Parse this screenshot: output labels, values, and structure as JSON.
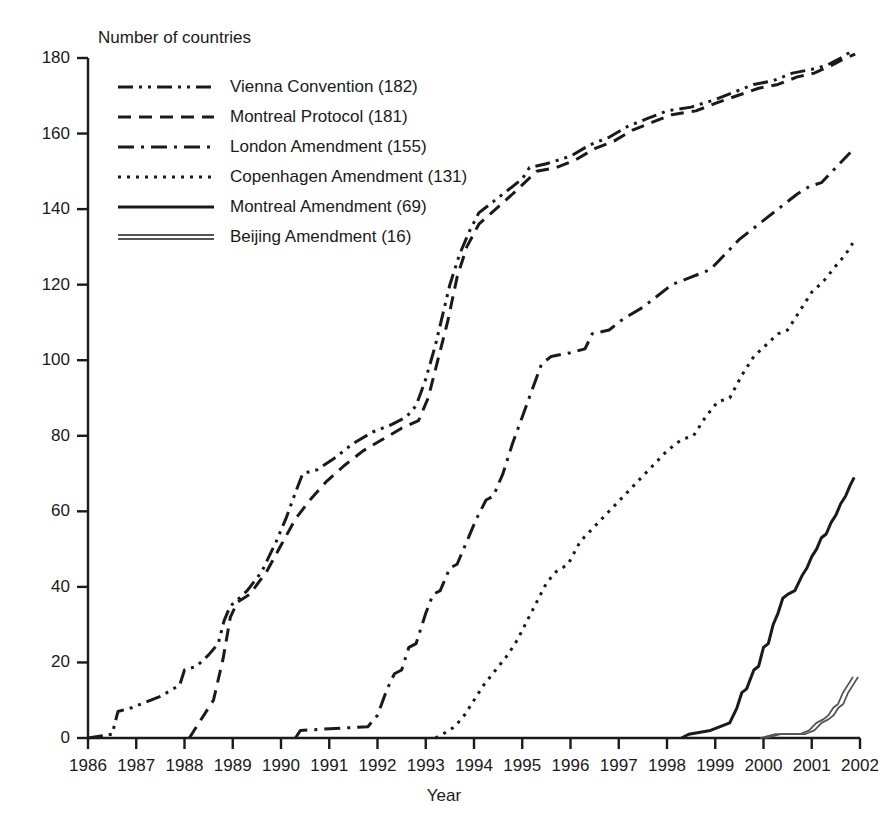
{
  "chart_data": {
    "type": "line",
    "title": "",
    "ylabel": "Number of countries",
    "xlabel": "Year",
    "xlim": [
      1986,
      2002
    ],
    "ylim": [
      0,
      180
    ],
    "xticks": [
      "1986",
      "1987",
      "1988",
      "1989",
      "1990",
      "1991",
      "1992",
      "1993",
      "1994",
      "1995",
      "1996",
      "1997",
      "1998",
      "1999",
      "2000",
      "2001",
      "2002"
    ],
    "yticks": [
      "0",
      "20",
      "40",
      "60",
      "80",
      "100",
      "120",
      "140",
      "160",
      "180"
    ],
    "grid": false,
    "legend_position": "upper-left",
    "series": [
      {
        "name": "Vienna Convention (182)",
        "label": "Vienna Convention",
        "final_value": 182,
        "style": "dash-dot-dot",
        "color": "#1a1a1a",
        "points": [
          [
            1986.0,
            0
          ],
          [
            1986.5,
            1
          ],
          [
            1986.62,
            7
          ],
          [
            1986.9,
            8
          ],
          [
            1987.5,
            11
          ],
          [
            1987.9,
            14
          ],
          [
            1988.0,
            18
          ],
          [
            1988.25,
            19
          ],
          [
            1988.5,
            22
          ],
          [
            1988.7,
            25
          ],
          [
            1988.82,
            31
          ],
          [
            1988.95,
            35
          ],
          [
            1989.05,
            36
          ],
          [
            1989.3,
            39
          ],
          [
            1989.6,
            44
          ],
          [
            1989.9,
            52
          ],
          [
            1990.1,
            58
          ],
          [
            1990.3,
            65
          ],
          [
            1990.45,
            70
          ],
          [
            1990.75,
            71
          ],
          [
            1991.1,
            74
          ],
          [
            1991.5,
            78
          ],
          [
            1991.9,
            81
          ],
          [
            1992.3,
            83
          ],
          [
            1992.6,
            85
          ],
          [
            1992.8,
            88
          ],
          [
            1993.0,
            95
          ],
          [
            1993.2,
            104
          ],
          [
            1993.35,
            112
          ],
          [
            1993.5,
            120
          ],
          [
            1993.7,
            128
          ],
          [
            1993.9,
            134
          ],
          [
            1994.1,
            139
          ],
          [
            1994.4,
            142
          ],
          [
            1994.7,
            145
          ],
          [
            1995.0,
            148
          ],
          [
            1995.15,
            151
          ],
          [
            1995.5,
            152
          ],
          [
            1996.0,
            154
          ],
          [
            1996.4,
            157
          ],
          [
            1996.8,
            159
          ],
          [
            1997.2,
            162
          ],
          [
            1997.6,
            164
          ],
          [
            1998.0,
            166
          ],
          [
            1998.5,
            167
          ],
          [
            1999.0,
            169
          ],
          [
            1999.4,
            171
          ],
          [
            1999.8,
            173
          ],
          [
            2000.2,
            174
          ],
          [
            2000.6,
            176
          ],
          [
            2001.0,
            177
          ],
          [
            2001.3,
            178
          ],
          [
            2001.6,
            180
          ],
          [
            2001.85,
            182
          ]
        ]
      },
      {
        "name": "Montreal Protocol (181)",
        "label": "Montreal Protocol",
        "final_value": 181,
        "style": "dashed",
        "color": "#1a1a1a",
        "points": [
          [
            1988.1,
            0
          ],
          [
            1988.3,
            4
          ],
          [
            1988.6,
            10
          ],
          [
            1988.8,
            21
          ],
          [
            1988.95,
            32
          ],
          [
            1989.1,
            36
          ],
          [
            1989.35,
            38
          ],
          [
            1989.7,
            44
          ],
          [
            1990.0,
            51
          ],
          [
            1990.3,
            58
          ],
          [
            1990.6,
            63
          ],
          [
            1990.95,
            68
          ],
          [
            1991.3,
            72
          ],
          [
            1991.7,
            76
          ],
          [
            1992.1,
            79
          ],
          [
            1992.5,
            82
          ],
          [
            1992.85,
            84
          ],
          [
            1993.05,
            90
          ],
          [
            1993.25,
            100
          ],
          [
            1993.45,
            110
          ],
          [
            1993.65,
            122
          ],
          [
            1993.85,
            130
          ],
          [
            1994.1,
            136
          ],
          [
            1994.45,
            140
          ],
          [
            1994.8,
            144
          ],
          [
            1995.05,
            147
          ],
          [
            1995.3,
            150
          ],
          [
            1995.7,
            151
          ],
          [
            1996.1,
            153
          ],
          [
            1996.5,
            156
          ],
          [
            1996.9,
            158
          ],
          [
            1997.3,
            161
          ],
          [
            1997.7,
            163
          ],
          [
            1998.1,
            165
          ],
          [
            1998.6,
            166
          ],
          [
            1999.0,
            168
          ],
          [
            1999.45,
            170
          ],
          [
            1999.9,
            172
          ],
          [
            2000.3,
            173
          ],
          [
            2000.7,
            175
          ],
          [
            2001.05,
            176
          ],
          [
            2001.4,
            178
          ],
          [
            2001.7,
            180
          ],
          [
            2001.9,
            181
          ]
        ]
      },
      {
        "name": "London Amendment (155)",
        "label": "London Amendment",
        "final_value": 155,
        "style": "dash-dot",
        "color": "#1a1a1a",
        "points": [
          [
            1990.3,
            0
          ],
          [
            1990.4,
            2
          ],
          [
            1991.8,
            3
          ],
          [
            1992.0,
            6
          ],
          [
            1992.2,
            13
          ],
          [
            1992.35,
            17
          ],
          [
            1992.5,
            18
          ],
          [
            1992.65,
            24
          ],
          [
            1992.8,
            25
          ],
          [
            1993.0,
            33
          ],
          [
            1993.15,
            38
          ],
          [
            1993.3,
            39
          ],
          [
            1993.5,
            45
          ],
          [
            1993.65,
            46
          ],
          [
            1993.85,
            52
          ],
          [
            1994.05,
            58
          ],
          [
            1994.25,
            63
          ],
          [
            1994.4,
            64
          ],
          [
            1994.6,
            70
          ],
          [
            1994.8,
            78
          ],
          [
            1995.0,
            85
          ],
          [
            1995.2,
            92
          ],
          [
            1995.4,
            99
          ],
          [
            1995.6,
            101
          ],
          [
            1996.0,
            102
          ],
          [
            1996.3,
            103
          ],
          [
            1996.45,
            107
          ],
          [
            1996.8,
            108
          ],
          [
            1997.1,
            111
          ],
          [
            1997.5,
            114
          ],
          [
            1997.8,
            117
          ],
          [
            1998.1,
            120
          ],
          [
            1998.5,
            122
          ],
          [
            1998.9,
            124
          ],
          [
            1999.2,
            128
          ],
          [
            1999.5,
            132
          ],
          [
            1999.8,
            135
          ],
          [
            2000.1,
            138
          ],
          [
            2000.4,
            141
          ],
          [
            2000.7,
            144
          ],
          [
            2000.95,
            146
          ],
          [
            2001.2,
            147
          ],
          [
            2001.5,
            151
          ],
          [
            2001.8,
            155
          ]
        ]
      },
      {
        "name": "Copenhagen Amendment (131)",
        "label": "Copenhagen Amendment",
        "final_value": 131,
        "style": "dotted",
        "color": "#1a1a1a",
        "points": [
          [
            1993.2,
            0
          ],
          [
            1993.35,
            1
          ],
          [
            1993.6,
            3
          ],
          [
            1993.8,
            6
          ],
          [
            1994.0,
            10
          ],
          [
            1994.2,
            14
          ],
          [
            1994.45,
            18
          ],
          [
            1994.7,
            22
          ],
          [
            1994.9,
            26
          ],
          [
            1995.1,
            31
          ],
          [
            1995.3,
            36
          ],
          [
            1995.5,
            41
          ],
          [
            1995.7,
            44
          ],
          [
            1995.95,
            46
          ],
          [
            1996.2,
            52
          ],
          [
            1996.5,
            56
          ],
          [
            1996.8,
            60
          ],
          [
            1997.1,
            64
          ],
          [
            1997.4,
            68
          ],
          [
            1997.7,
            72
          ],
          [
            1998.0,
            76
          ],
          [
            1998.3,
            79
          ],
          [
            1998.55,
            80
          ],
          [
            1998.8,
            85
          ],
          [
            1999.05,
            89
          ],
          [
            1999.3,
            90
          ],
          [
            1999.55,
            96
          ],
          [
            1999.8,
            101
          ],
          [
            2000.05,
            104
          ],
          [
            2000.3,
            107
          ],
          [
            2000.5,
            108
          ],
          [
            2000.75,
            113
          ],
          [
            2001.0,
            118
          ],
          [
            2001.25,
            121
          ],
          [
            2001.5,
            125
          ],
          [
            2001.7,
            128
          ],
          [
            2001.85,
            131
          ]
        ]
      },
      {
        "name": "Montreal Amendment (69)",
        "label": "Montreal Amendment",
        "final_value": 69,
        "style": "solid",
        "color": "#1a1a1a",
        "points": [
          [
            1998.3,
            0
          ],
          [
            1998.45,
            1
          ],
          [
            1998.9,
            2
          ],
          [
            1999.1,
            3
          ],
          [
            1999.3,
            4
          ],
          [
            1999.45,
            8
          ],
          [
            1999.55,
            12
          ],
          [
            1999.65,
            13
          ],
          [
            1999.8,
            18
          ],
          [
            1999.9,
            19
          ],
          [
            2000.0,
            24
          ],
          [
            2000.1,
            25
          ],
          [
            2000.2,
            30
          ],
          [
            2000.3,
            33
          ],
          [
            2000.4,
            37
          ],
          [
            2000.5,
            38
          ],
          [
            2000.65,
            39
          ],
          [
            2000.8,
            43
          ],
          [
            2000.9,
            45
          ],
          [
            2001.0,
            48
          ],
          [
            2001.1,
            50
          ],
          [
            2001.2,
            53
          ],
          [
            2001.3,
            54
          ],
          [
            2001.4,
            57
          ],
          [
            2001.5,
            59
          ],
          [
            2001.6,
            62
          ],
          [
            2001.7,
            64
          ],
          [
            2001.8,
            67
          ],
          [
            2001.88,
            69
          ]
        ]
      },
      {
        "name": "Beijing Amendment (16)",
        "label": "Beijing Amendment",
        "final_value": 16,
        "style": "double",
        "color": "#555555",
        "points": [
          [
            2000.0,
            0
          ],
          [
            2000.3,
            1
          ],
          [
            2000.8,
            1
          ],
          [
            2001.0,
            2
          ],
          [
            2001.15,
            4
          ],
          [
            2001.3,
            5
          ],
          [
            2001.4,
            6
          ],
          [
            2001.5,
            8
          ],
          [
            2001.6,
            9
          ],
          [
            2001.7,
            12
          ],
          [
            2001.8,
            14
          ],
          [
            2001.9,
            16
          ]
        ]
      }
    ]
  },
  "legend": {
    "items": [
      {
        "label": "Vienna Convention (182)",
        "swatch": "dash-dot-dot"
      },
      {
        "label": "Montreal Protocol (181)",
        "swatch": "dashed"
      },
      {
        "label": "London Amendment (155)",
        "swatch": "dash-dot"
      },
      {
        "label": "Copenhagen Amendment (131)",
        "swatch": "dotted"
      },
      {
        "label": "Montreal Amendment (69)",
        "swatch": "solid"
      },
      {
        "label": "Beijing Amendment (16)",
        "swatch": "double"
      }
    ]
  }
}
